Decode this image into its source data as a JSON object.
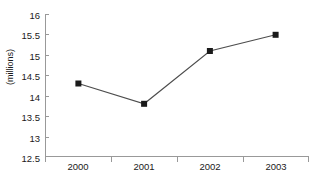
{
  "chart_data": {
    "type": "line",
    "title": "",
    "subtitle": "",
    "xlabel": "",
    "ylabel": "(millions)",
    "categories": [
      "2000",
      "2001",
      "2002",
      "2003"
    ],
    "values": [
      14.3,
      13.8,
      15.1,
      15.5
    ],
    "series": [
      {
        "name": "",
        "values": [
          14.3,
          13.8,
          15.1,
          15.5
        ]
      }
    ],
    "ylim": [
      12.5,
      16
    ],
    "yticks": [
      "12.5",
      "13",
      "13.5",
      "14",
      "14.5",
      "15",
      "15.5",
      "16"
    ],
    "ytick_values": [
      12.5,
      13,
      13.5,
      14,
      14.5,
      15,
      15.5,
      16
    ],
    "grid": false,
    "legend": "none",
    "marker": "square",
    "colors": {
      "line": "#4d4d4d",
      "marker": "#1a1a1a",
      "axis": "#999999",
      "text": "#1a1a1a",
      "background": "#ffffff"
    }
  }
}
